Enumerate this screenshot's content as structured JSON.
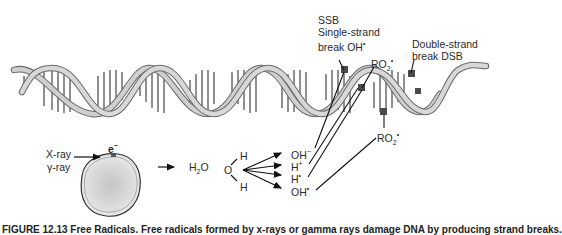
{
  "figure": {
    "caption": "FIGURE 12.13 Free Radicals. Free radicals formed by x-rays or gamma rays damage DNA by producing strand breaks."
  },
  "dna": {
    "ssb_label": {
      "line1": "SSB",
      "line2": "Single-strand",
      "line3": "break OH",
      "radical_dot": "•"
    },
    "ro2_upper": {
      "text": "RO",
      "sub": "2",
      "dot": "•"
    },
    "dsb_label": {
      "line1": "Double-strand",
      "line2": "break DSB"
    },
    "ro2_lower": {
      "text": "RO",
      "sub": "2",
      "dot": "•"
    }
  },
  "radiation": {
    "xray": "X-ray",
    "gammaray": "γ-ray",
    "electron": "e",
    "electron_sup": "−"
  },
  "water": {
    "formula": "H",
    "formula_sub": "2",
    "formula_tail": "O",
    "molecule": {
      "o": "O",
      "h_top": "H",
      "h_bottom": "H"
    }
  },
  "radicals": [
    {
      "base": "OH",
      "sup": "−"
    },
    {
      "base": "H",
      "sup": "+"
    },
    {
      "base": "H",
      "sup": "•"
    },
    {
      "base": "OH",
      "sup": "•"
    }
  ],
  "colors": {
    "helix_fill": "#c8c8c8",
    "helix_stroke": "#6a6a6a",
    "rungs": "#222222",
    "damage": "#4a4a4a",
    "cell_fill": "#d6d6d6"
  }
}
